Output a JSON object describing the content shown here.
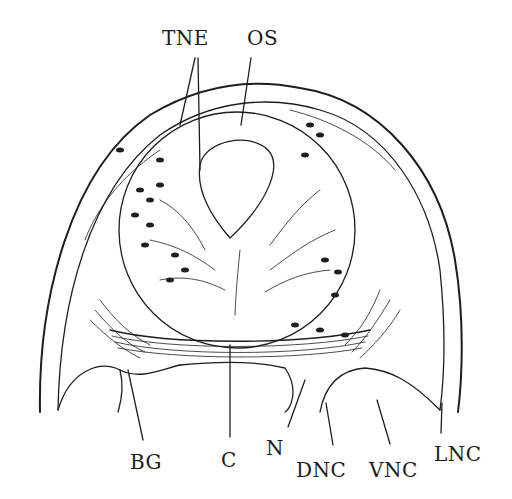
{
  "diagram": {
    "labels": {
      "tne": "TNE",
      "os": "OS",
      "bg": "BG",
      "c": "C",
      "n": "N",
      "dnc": "DNC",
      "vnc": "VNC",
      "lnc": "LNC"
    },
    "colors": {
      "ink": "#1e1e1e",
      "background": "#ffffff"
    }
  }
}
